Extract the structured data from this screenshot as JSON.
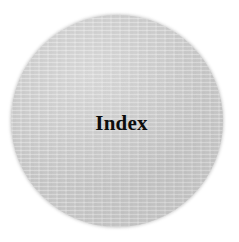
{
  "page": {
    "title": "Index",
    "width": 239,
    "height": 242,
    "background_color": "#ffffff"
  },
  "graphic": {
    "name": "gray-circle",
    "shape": "circle",
    "fill_color": "#c9c9c9",
    "edge": "soft-feathered",
    "texture": "fine-horizontal-grain",
    "center_x": 117,
    "center_y": 121,
    "diameter": 212
  },
  "label": {
    "text": "Index",
    "color": "#0d0d0d",
    "weight": "bold",
    "style": "serif",
    "size_px": 21,
    "center_x": 119,
    "center_y": 123
  }
}
